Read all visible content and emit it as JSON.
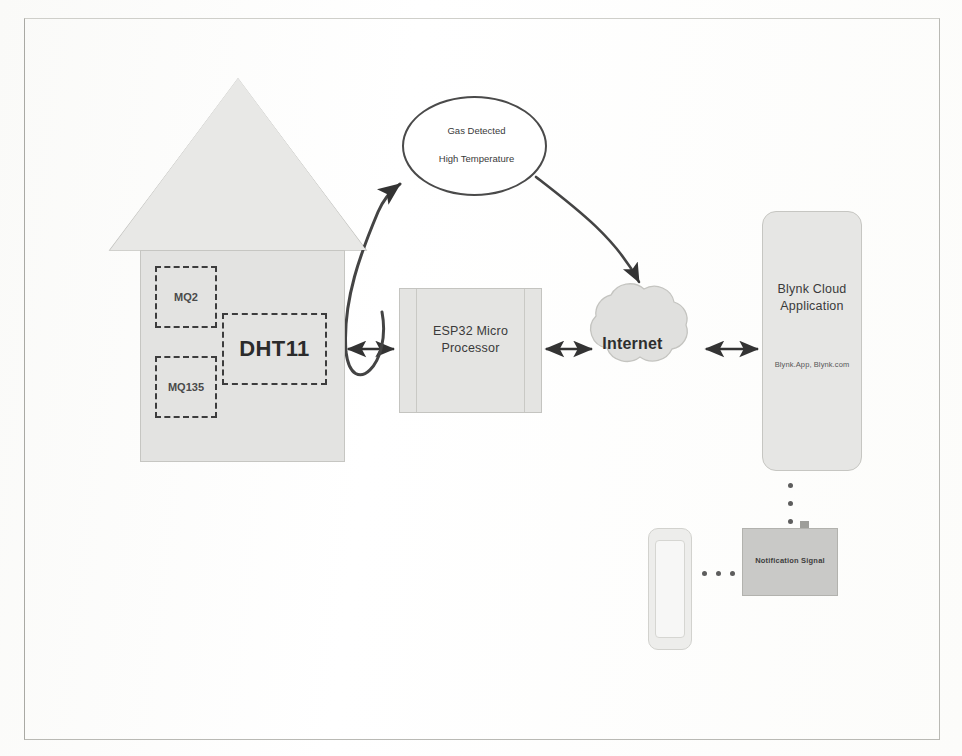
{
  "diagram": {
    "background_color": "#ffffff",
    "frame_color": "#b9b9b4",
    "nodes": {
      "house": {
        "name": "House",
        "fill": "#e3e3e1",
        "sensors": [
          {
            "id": "mq2",
            "label": "MQ2"
          },
          {
            "id": "mq135",
            "label": "MQ135"
          },
          {
            "id": "dht11",
            "label": "DHT11"
          }
        ]
      },
      "alert": {
        "line1": "Gas Detected",
        "line2": "High Temperature"
      },
      "esp32": {
        "label": "ESP32 Micro\nProcessor",
        "fill": "#e4e4e2"
      },
      "internet": {
        "label": "Internet",
        "fill": "#e0e0de"
      },
      "blynk": {
        "title": "Blynk Cloud\nApplication",
        "url": "Blynk.App, Blynk.com",
        "fill": "#e6e6e4"
      },
      "notification": {
        "label": "Notification Signal",
        "fill": "#c9c9c7"
      },
      "phone": {
        "name": "Smartphone"
      }
    },
    "connectors": [
      {
        "id": "house-esp32",
        "from": "house",
        "to": "esp32",
        "style": "double-arrow"
      },
      {
        "id": "esp32-internet",
        "from": "esp32",
        "to": "internet",
        "style": "double-arrow"
      },
      {
        "id": "internet-blynk",
        "from": "internet",
        "to": "blynk",
        "style": "double-arrow"
      },
      {
        "id": "sensors-alert",
        "from": "dht11",
        "to": "alert",
        "style": "curved-arrow"
      },
      {
        "id": "alert-internet",
        "from": "alert",
        "to": "internet",
        "style": "curved-arrow"
      },
      {
        "id": "blynk-notification",
        "from": "blynk",
        "to": "notification",
        "style": "dotted"
      },
      {
        "id": "notification-phone",
        "from": "notification",
        "to": "phone",
        "style": "dotted"
      }
    ]
  }
}
